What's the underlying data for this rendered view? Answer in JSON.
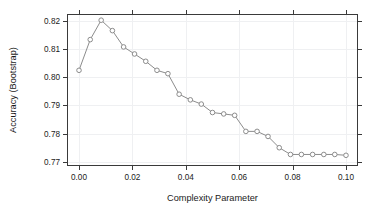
{
  "chart_data": {
    "type": "line",
    "title": "",
    "xlabel": "Complexity Parameter",
    "ylabel": "Accuracy (Bootstrap)",
    "xlim": [
      -0.0045,
      0.1045
    ],
    "ylim": [
      0.7685,
      0.8225
    ],
    "xticks": [
      0.0,
      0.02,
      0.04,
      0.06,
      0.08,
      0.1
    ],
    "xticklabels": [
      "0.00",
      "0.02",
      "0.04",
      "0.06",
      "0.08",
      "0.10"
    ],
    "yticks": [
      0.77,
      0.78,
      0.79,
      0.8,
      0.81,
      0.82
    ],
    "yticklabels": [
      "0.77",
      "0.78",
      "0.79",
      "0.80",
      "0.81",
      "0.82"
    ],
    "grid": true,
    "legend": false,
    "marker": "open-circle",
    "line_color": "#8c8c8c",
    "marker_fill": "#ffffff",
    "marker_stroke": "#8c8c8c",
    "axis_color": "#3a3a3a",
    "grid_color": "#eff0f2",
    "background": "#ffffff",
    "x": [
      0.0,
      0.0042,
      0.0083,
      0.0125,
      0.0167,
      0.0208,
      0.025,
      0.0292,
      0.0333,
      0.0375,
      0.0417,
      0.0458,
      0.05,
      0.0542,
      0.0583,
      0.0625,
      0.0667,
      0.0708,
      0.075,
      0.0792,
      0.0833,
      0.0875,
      0.0917,
      0.0958,
      0.1
    ],
    "y": [
      0.8025,
      0.8134,
      0.8203,
      0.8166,
      0.8108,
      0.8083,
      0.8057,
      0.8025,
      0.8013,
      0.794,
      0.792,
      0.7905,
      0.7875,
      0.787,
      0.7865,
      0.7808,
      0.7808,
      0.779,
      0.775,
      0.7726,
      0.7726,
      0.7726,
      0.7726,
      0.7726,
      0.7723
    ],
    "series": [
      {
        "name": "Accuracy (Bootstrap)",
        "values": [
          0.8025,
          0.8134,
          0.8203,
          0.8166,
          0.8108,
          0.8083,
          0.8057,
          0.8025,
          0.8013,
          0.794,
          0.792,
          0.7905,
          0.7875,
          0.787,
          0.7865,
          0.7808,
          0.7808,
          0.779,
          0.775,
          0.7726,
          0.7726,
          0.7726,
          0.7726,
          0.7726,
          0.7723
        ]
      }
    ]
  },
  "plot_geometry": {
    "left": 67,
    "right": 358,
    "top": 14,
    "bottom": 166
  }
}
